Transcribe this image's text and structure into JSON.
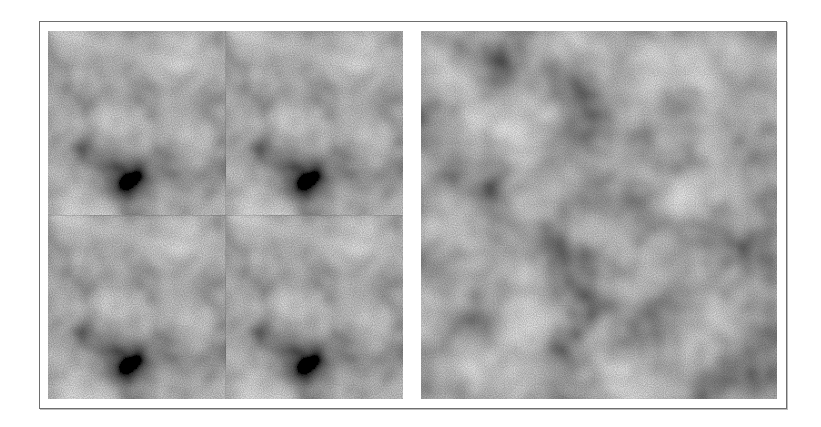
{
  "figure": {
    "panels": [
      {
        "id": "left",
        "description": "tiled texture (2x2 repetition with visible seams)"
      },
      {
        "id": "right",
        "description": "synthesized seamless texture"
      }
    ],
    "colors": {
      "frame_border": "#6e6e6e",
      "background": "#ffffff",
      "texture_mid": "#8a8a8a"
    }
  }
}
